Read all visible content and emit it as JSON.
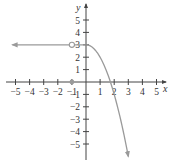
{
  "chart_data": {
    "type": "line",
    "title": "",
    "xlabel": "x",
    "ylabel": "y",
    "xlim": [
      -5,
      5
    ],
    "ylim": [
      -6,
      6
    ],
    "grid": false,
    "legend": null,
    "x_ticks": [
      -5,
      -4,
      -3,
      -2,
      -1,
      1,
      2,
      3,
      4,
      5
    ],
    "x_tick_labels": [
      "−5",
      "−4",
      "−3",
      "−2",
      "−1",
      "1",
      "2",
      "3",
      "4",
      "5"
    ],
    "y_ticks": [
      5,
      4,
      3,
      2,
      1,
      -1,
      -2,
      -3,
      -4,
      -5
    ],
    "y_tick_labels": [
      "5",
      "4",
      "3",
      "2",
      "1",
      "−1",
      "−2",
      "−3",
      "−4",
      "−5"
    ],
    "series": [
      {
        "name": "f(x)",
        "description": "Piecewise: y = 3 for x < 0 (arrow to the left, open circle at x = -1), y = 3 - x^2 for x >= 0 (arrow downward); isolated filled point at (-1, 0)",
        "pieces": [
          {
            "kind": "horizontal",
            "x": [
              -5.5,
              0
            ],
            "y": 3,
            "left_arrow": true
          },
          {
            "kind": "curve",
            "formula": "3 - x^2",
            "x": [
              0,
              3
            ],
            "points": [
              [
                0,
                3
              ],
              [
                0.5,
                2.75
              ],
              [
                1,
                2
              ],
              [
                1.5,
                0.75
              ],
              [
                1.73,
                0
              ],
              [
                2,
                -1
              ],
              [
                2.5,
                -3.25
              ],
              [
                3,
                -6
              ]
            ],
            "end_arrow": true
          }
        ],
        "open_points": [
          [
            -1,
            3
          ]
        ],
        "closed_points": [
          [
            -1,
            0
          ]
        ],
        "color": "#9a9a9a"
      }
    ]
  },
  "axes": {
    "x_label": "x",
    "y_label": "y",
    "color": "#444444"
  }
}
